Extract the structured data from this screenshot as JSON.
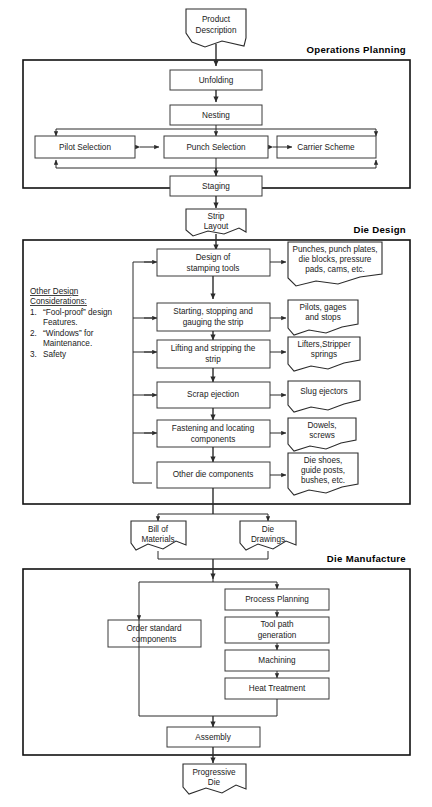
{
  "diagram": {
    "caption": "",
    "sections": [
      {
        "id": "operations-planning",
        "label": "Operations Planning"
      },
      {
        "id": "die-design",
        "label": "Die Design"
      },
      {
        "id": "die-manufacture",
        "label": "Die Manufacture"
      }
    ],
    "documents": [
      {
        "id": "product-description",
        "lines": [
          "Product",
          "Description"
        ]
      },
      {
        "id": "strip-layout",
        "lines": [
          "Strip",
          "Layout"
        ]
      },
      {
        "id": "bill-of-materials",
        "lines": [
          "Bill of",
          "Materials"
        ]
      },
      {
        "id": "die-drawings",
        "lines": [
          "Die",
          "Drawings"
        ]
      },
      {
        "id": "progressive-die",
        "lines": [
          "Progressive",
          "Die"
        ]
      },
      {
        "id": "punches-note",
        "lines": [
          "Punches, punch plates,",
          "die blocks, pressure",
          "pads, cams, etc."
        ]
      },
      {
        "id": "pilots-note",
        "lines": [
          "Pilots, gages",
          "and stops"
        ]
      },
      {
        "id": "lifters-note",
        "lines": [
          "Lifters,Stripper",
          "springs"
        ]
      },
      {
        "id": "slug-note",
        "lines": [
          "Slug ejectors"
        ]
      },
      {
        "id": "dowels-note",
        "lines": [
          "Dowels,",
          "screws"
        ]
      },
      {
        "id": "dieshoes-note",
        "lines": [
          "Die shoes,",
          "guide posts,",
          "bushes, etc."
        ]
      }
    ],
    "process_boxes": [
      {
        "id": "unfolding",
        "lines": [
          "Unfolding"
        ]
      },
      {
        "id": "nesting",
        "lines": [
          "Nesting"
        ]
      },
      {
        "id": "pilot-selection",
        "lines": [
          "Pilot Selection"
        ]
      },
      {
        "id": "punch-selection",
        "lines": [
          "Punch Selection"
        ]
      },
      {
        "id": "carrier-scheme",
        "lines": [
          "Carrier Scheme"
        ]
      },
      {
        "id": "staging",
        "lines": [
          "Staging"
        ]
      },
      {
        "id": "design-stamping-tools",
        "lines": [
          "Design of",
          "stamping tools"
        ]
      },
      {
        "id": "starting-stopping",
        "lines": [
          "Starting, stopping and",
          "gauging the strip"
        ]
      },
      {
        "id": "lifting-stripping",
        "lines": [
          "Lifting and stripping the",
          "strip"
        ]
      },
      {
        "id": "scrap-ejection",
        "lines": [
          "Scrap ejection"
        ]
      },
      {
        "id": "fastening-locating",
        "lines": [
          "Fastening and locating",
          "components"
        ]
      },
      {
        "id": "other-die-components",
        "lines": [
          "Other die components"
        ]
      },
      {
        "id": "process-planning",
        "lines": [
          "Process Planning"
        ]
      },
      {
        "id": "tool-path-generation",
        "lines": [
          "Tool path",
          "generation"
        ]
      },
      {
        "id": "machining",
        "lines": [
          "Machining"
        ]
      },
      {
        "id": "heat-treatment",
        "lines": [
          "Heat Treatment"
        ]
      },
      {
        "id": "order-standard-components",
        "lines": [
          "Order standard",
          "components"
        ]
      },
      {
        "id": "assembly",
        "lines": [
          "Assembly"
        ]
      }
    ],
    "note": {
      "id": "other-design-considerations",
      "heading_lines": [
        "Other Design",
        "Considerations:"
      ],
      "items": [
        {
          "num": "1.",
          "lines": [
            "“Fool-proof” design",
            "Features."
          ]
        },
        {
          "num": "2.",
          "lines": [
            "“Windows” for",
            "Maintenance."
          ]
        },
        {
          "num": "3.",
          "lines": [
            "Safety"
          ]
        }
      ]
    },
    "colors": {
      "background": "#ffffff",
      "frame_stroke": "#111111",
      "box_stroke": "#3a3a3a",
      "line_stroke": "#2b2b2b",
      "text": "#1a1a1a"
    }
  }
}
